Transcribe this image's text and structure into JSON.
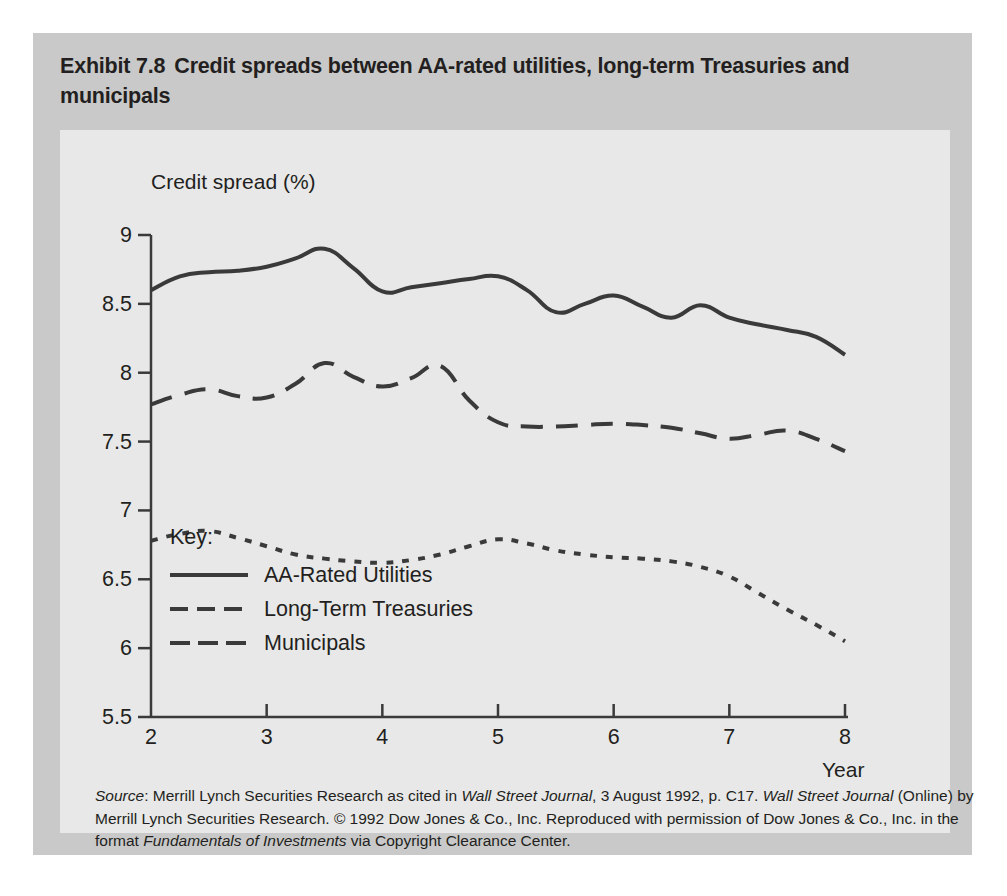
{
  "exhibit": {
    "number": "Exhibit 7.8",
    "title": "Credit spreads between AA-rated utilities, long-term Treasuries and municipals"
  },
  "source_note": {
    "label": "Source",
    "line1_a": ": Merrill Lynch Securities Research as cited in ",
    "wsj_1": "Wall Street Journal",
    "line1_b": ", 3 August 1992, p. C17. ",
    "wsj_2": "Wall Street Journal",
    "line2": "(Online) by Merrill Lynch Securities Research. © 1992 Dow Jones & Co., Inc. Reproduced with permission of Dow Jones",
    "line3_a": "& Co., Inc. in the format ",
    "book": "Fundamentals of Investments",
    "line3_b": " via Copyright Clearance Center."
  },
  "legend": {
    "title": "Key:",
    "items": [
      {
        "label": "AA-Rated Utilities",
        "style": "solid",
        "color": "#3a3a3a"
      },
      {
        "label": "Long-Term Treasuries",
        "style": "dashed",
        "color": "#3a3a3a"
      },
      {
        "label": "Municipals",
        "style": "dashed",
        "color": "#3a3a3a"
      }
    ]
  },
  "chart_data": {
    "type": "line",
    "title": "Credit spreads between AA-rated utilities, long-term Treasuries and municipals",
    "xlabel": "Year",
    "ylabel": "Credit spread (%)",
    "xlim": [
      2,
      8
    ],
    "ylim": [
      5.5,
      9
    ],
    "xticks": [
      2,
      3,
      4,
      5,
      6,
      7,
      8
    ],
    "xtick_labels": [
      "2",
      "3",
      "4",
      "5",
      "6",
      "7",
      "8"
    ],
    "yticks": [
      5.5,
      6,
      6.5,
      7,
      7.5,
      8,
      8.5,
      9
    ],
    "ytick_labels": [
      "5.5",
      "6",
      "6.5",
      "7",
      "7.5",
      "8",
      "8.5",
      "9"
    ],
    "grid": false,
    "legend_position": "inside-lower-left",
    "x": [
      2,
      2.25,
      2.5,
      2.75,
      3,
      3.25,
      3.5,
      3.75,
      4,
      4.25,
      4.5,
      4.75,
      5,
      5.25,
      5.5,
      5.75,
      6,
      6.25,
      6.5,
      6.75,
      7,
      7.25,
      7.5,
      7.75,
      8
    ],
    "series": [
      {
        "name": "AA-Rated Utilities",
        "style": "solid",
        "color": "#3a3a3a",
        "values": [
          8.6,
          8.7,
          8.73,
          8.74,
          8.77,
          8.83,
          8.9,
          8.76,
          8.59,
          8.62,
          8.65,
          8.68,
          8.7,
          8.6,
          8.44,
          8.5,
          8.56,
          8.48,
          8.4,
          8.49,
          8.4,
          8.35,
          8.31,
          8.26,
          8.13
        ]
      },
      {
        "name": "Long-Term Treasuries",
        "style": "dashed",
        "color": "#3a3a3a",
        "values": [
          7.77,
          7.84,
          7.88,
          7.83,
          7.82,
          7.92,
          8.07,
          7.97,
          7.9,
          7.96,
          8.05,
          7.8,
          7.64,
          7.61,
          7.61,
          7.62,
          7.63,
          7.62,
          7.6,
          7.56,
          7.52,
          7.55,
          7.58,
          7.52,
          7.43
        ]
      },
      {
        "name": "Municipals",
        "style": "dotted",
        "color": "#3a3a3a",
        "values": [
          6.78,
          6.83,
          6.85,
          6.8,
          6.74,
          6.68,
          6.65,
          6.63,
          6.62,
          6.64,
          6.68,
          6.74,
          6.79,
          6.76,
          6.71,
          6.68,
          6.66,
          6.65,
          6.63,
          6.59,
          6.52,
          6.4,
          6.28,
          6.17,
          6.05
        ]
      }
    ]
  }
}
